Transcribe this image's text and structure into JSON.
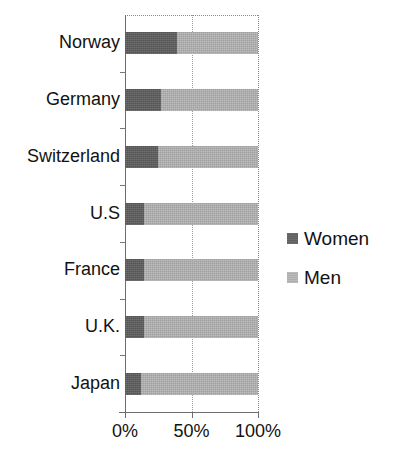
{
  "chart_data": {
    "type": "bar",
    "orientation": "horizontal",
    "stacked": true,
    "stack_total": 100,
    "title": "",
    "subtitle": "",
    "xlabel": "",
    "ylabel": "",
    "categories": [
      "Norway",
      "Germany",
      "Switzerland",
      "U.S",
      "France",
      "U.K.",
      "Japan"
    ],
    "series": [
      {
        "name": "Women",
        "color": "#5e5e5e",
        "values": [
          39,
          27,
          25,
          14,
          14,
          14,
          12
        ]
      },
      {
        "name": "Men",
        "color": "#aeaeae",
        "values": [
          61,
          73,
          75,
          86,
          86,
          86,
          88
        ]
      }
    ],
    "xlim": [
      0,
      100
    ],
    "xticks": [
      0,
      50,
      100
    ],
    "xtick_labels": [
      "0%",
      "50%",
      "100%"
    ],
    "grid": true,
    "gridlines_at": [
      50
    ],
    "legend_position": "right",
    "legend_entries": [
      "Women",
      "Men"
    ]
  },
  "axis": {
    "tick_0": "0%",
    "tick_50": "50%",
    "tick_100": "100%"
  },
  "legend": {
    "women_label": "Women",
    "men_label": "Men"
  },
  "labels": {
    "norway": "Norway",
    "germany": "Germany",
    "switzerland": "Switzerland",
    "us": "U.S",
    "france": "France",
    "uk": "U.K.",
    "japan": "Japan"
  }
}
